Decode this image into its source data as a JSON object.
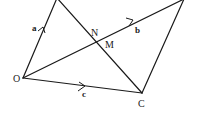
{
  "diagram": {
    "points": {
      "O": {
        "label": "O"
      },
      "C": {
        "label": "C"
      },
      "N": {
        "label": "N"
      },
      "M": {
        "label": "M"
      }
    },
    "vectors": {
      "a": {
        "label": "a",
        "from": "O",
        "to": "A"
      },
      "b": {
        "label": "b",
        "from": "O",
        "to": "B"
      },
      "c": {
        "label": "c",
        "from": "O",
        "to": "C"
      }
    },
    "segments": [
      {
        "name": "OA"
      },
      {
        "name": "OB"
      },
      {
        "name": "OC"
      },
      {
        "name": "AC"
      },
      {
        "name": "BC"
      }
    ],
    "colors": {
      "stroke": "#1a1a1a",
      "background": "#ffffff"
    }
  }
}
